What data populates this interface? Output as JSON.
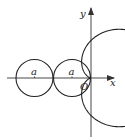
{
  "diagram": {
    "axes": {
      "x_label": "x",
      "y_label": "y",
      "origin_label": "O"
    },
    "circles": [
      {
        "label": "a"
      },
      {
        "label": "a"
      }
    ],
    "colors": {
      "stroke": "#222222",
      "axis": "#333333",
      "background": "#ffffff"
    }
  }
}
